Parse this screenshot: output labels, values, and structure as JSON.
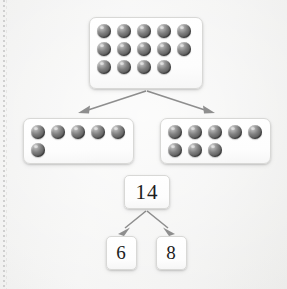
{
  "worksheet": {
    "title": "Number bond decomposition of 14 with counters",
    "margin_rule": "dotted-vertical-margin"
  },
  "colors": {
    "page_background": "#f0f0ef",
    "card_background": "#ffffff",
    "card_border": "#d8d8d6",
    "counter_fill": "#5f5f5f",
    "counter_highlight": "#cfcfcf",
    "arrow_stroke": "#8e8e8e",
    "text": "#1c1c1c"
  },
  "counter_boxes": {
    "total": {
      "name": "total-counters-box",
      "count": 14,
      "rows": [
        5,
        5,
        4
      ],
      "label": "14 counters"
    },
    "left_part": {
      "name": "left-part-counters-box",
      "count": 6,
      "rows": [
        5,
        1
      ],
      "label": "6 counters"
    },
    "right_part": {
      "name": "right-part-counters-box",
      "count": 8,
      "rows": [
        5,
        3
      ],
      "label": "8 counters"
    }
  },
  "number_bond": {
    "total": "14",
    "part_left": "6",
    "part_right": "8",
    "equation": "14 = 6 + 8"
  },
  "arrows": [
    {
      "name": "arrow-total-to-left-part",
      "from": "total-counters-box",
      "to": "left-part-counters-box"
    },
    {
      "name": "arrow-total-to-right-part",
      "from": "total-counters-box",
      "to": "right-part-counters-box"
    },
    {
      "name": "arrow-total-to-part-left",
      "from": "total-number-card",
      "to": "left-part-number-card"
    },
    {
      "name": "arrow-total-to-part-right",
      "from": "total-number-card",
      "to": "right-part-number-card"
    }
  ]
}
